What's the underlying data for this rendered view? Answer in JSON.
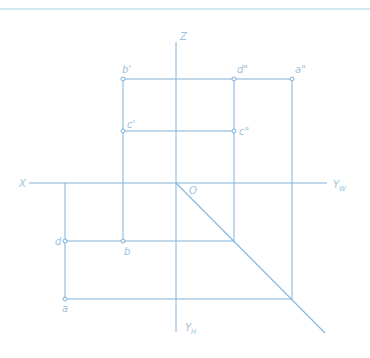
{
  "diagram": {
    "type": "orthographic-projection",
    "colors": {
      "line": "#7fb4de",
      "label": "#9cc3e2",
      "top_border": "#a8d3e6",
      "background": "#ffffff"
    },
    "axes": {
      "z_label": "Z",
      "x_label": "X",
      "yw_label": "Y",
      "yw_sub": "W",
      "yh_label": "Y",
      "yh_sub": "H",
      "origin_label": "O"
    },
    "points": {
      "b_prime": "b'",
      "d_dprime": "d\"",
      "a_dprime": "a\"",
      "c_prime": "c'",
      "c_dprime": "c\"",
      "d": "d",
      "b": "b",
      "a": "a"
    }
  }
}
